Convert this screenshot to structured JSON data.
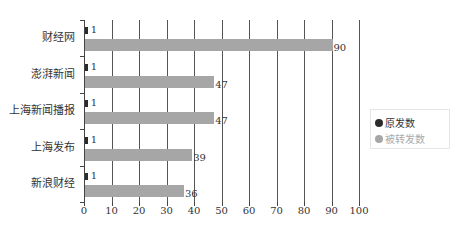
{
  "chart_data": {
    "type": "bar",
    "orientation": "horizontal",
    "title": "",
    "xlabel": "",
    "ylabel": "",
    "xlim": [
      0,
      100
    ],
    "x_ticks": [
      "0",
      "10",
      "20",
      "30",
      "40",
      "50",
      "60",
      "70",
      "80",
      "90",
      "100"
    ],
    "categories": [
      "财经网",
      "澎湃新闻",
      "上海新闻播报",
      "上海发布",
      "新浪财经"
    ],
    "series": [
      {
        "name": "原发数",
        "color": "#2b2b2b",
        "values": [
          1,
          1,
          1,
          1,
          1
        ]
      },
      {
        "name": "被转发数",
        "color": "#a6a6a6",
        "values": [
          90,
          47,
          47,
          39,
          36
        ]
      }
    ],
    "grid": "vertical",
    "legend_position": "right"
  },
  "legend": {
    "items": [
      {
        "label": "原发数",
        "color": "#2b2b2b"
      },
      {
        "label": "被转发数",
        "color": "#a6a6a6"
      }
    ]
  },
  "footer": {
    "text": ""
  }
}
